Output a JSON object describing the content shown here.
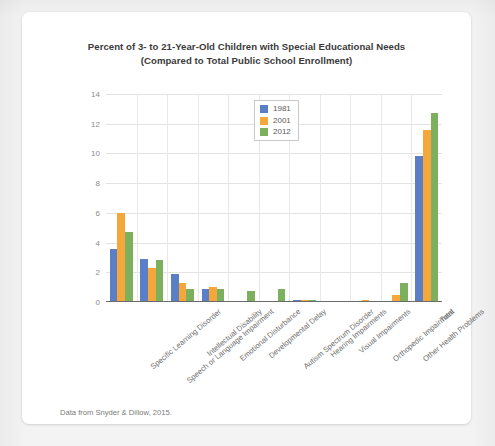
{
  "chart_data": {
    "type": "bar",
    "title": "Percent of 3- to 21-Year-Old Children with Special Educational Needs (Compared to Total Public School Enrollment)",
    "title_line1": "Percent of 3- to 21-Year-Old Children with Special Educational Needs",
    "title_line2": "(Compared to Total Public School Enrollment)",
    "xlabel": "",
    "ylabel": "",
    "ylim": [
      0,
      14
    ],
    "yticks": [
      0,
      2,
      4,
      6,
      8,
      10,
      12,
      14
    ],
    "ytick_labels": [
      "0",
      "2",
      "4",
      "6",
      "8",
      "10",
      "12",
      "14"
    ],
    "grid": true,
    "legend_position": "top-center",
    "categories": [
      "Specific Learning Disorder",
      "Speech or Language Impairment",
      "Intellectual Disability",
      "Emotional Disturbance",
      "Developmental Delay",
      "Autism Spectrum Disorder",
      "Hearing Impairments",
      "Visual Impairments",
      "Orthopedic Impairment",
      "Other Health Problems",
      "Total"
    ],
    "series": [
      {
        "name": "1981",
        "color": "#5b7fc7",
        "values": [
          3.6,
          2.9,
          1.9,
          0.85,
          0,
          0,
          0.14,
          0.06,
          0.06,
          0.1,
          9.8
        ]
      },
      {
        "name": "2001",
        "color": "#f5a73b",
        "values": [
          6.0,
          2.3,
          1.25,
          1.0,
          0,
          0,
          0.14,
          0.05,
          0.15,
          0.5,
          11.6
        ]
      },
      {
        "name": "2012",
        "color": "#7cb05c",
        "values": [
          4.7,
          2.8,
          0.85,
          0.9,
          0.75,
          0.9,
          0.12,
          0.05,
          0.1,
          1.3,
          12.7
        ]
      }
    ]
  },
  "legend": {
    "entries": [
      {
        "label": "1981",
        "color": "#5b7fc7"
      },
      {
        "label": "2001",
        "color": "#f5a73b"
      },
      {
        "label": "2012",
        "color": "#7cb05c"
      }
    ]
  },
  "source_note": "Data from Snyder & Dillow, 2015.",
  "colors": {
    "series_1981": "#5b7fc7",
    "series_2001": "#f5a73b",
    "series_2012": "#7cb05c",
    "card_background": "#ffffff",
    "page_background": "#f3f3f3",
    "axis": "#6b6b6b",
    "gridline": "#e3e3e3",
    "title_text": "#3b3b3b",
    "tick_text": "#8d8d8d"
  }
}
